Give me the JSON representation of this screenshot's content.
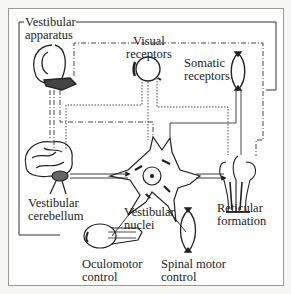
{
  "diagram": {
    "type": "schematic",
    "nodes": [
      {
        "id": "vestibular_apparatus",
        "label_lines": [
          "Vestibular",
          "apparatus"
        ],
        "role": "input"
      },
      {
        "id": "visual_receptors",
        "label_lines": [
          "Visual",
          "receptors"
        ],
        "role": "input"
      },
      {
        "id": "somatic_receptors",
        "label_lines": [
          "Somatic",
          "receptors"
        ],
        "role": "input"
      },
      {
        "id": "vestibular_cerebellum",
        "label_lines": [
          "Vestibular",
          "cerebellum"
        ],
        "role": "integrator"
      },
      {
        "id": "vestibular_nuclei",
        "label_lines": [
          "Vestibular",
          "nuclei"
        ],
        "role": "integrator"
      },
      {
        "id": "reticular_formation",
        "label_lines": [
          "Reticular",
          "formation"
        ],
        "role": "integrator"
      },
      {
        "id": "oculomotor_control",
        "label_lines": [
          "Oculomotor",
          "control"
        ],
        "role": "output"
      },
      {
        "id": "spinal_motor_control",
        "label_lines": [
          "Spinal motor",
          "control"
        ],
        "role": "output"
      }
    ],
    "edges": [
      {
        "from": "vestibular_apparatus",
        "to": "vestibular_cerebellum",
        "style": "dash-dot"
      },
      {
        "from": "vestibular_apparatus",
        "to": "vestibular_nuclei",
        "style": "dash-dot"
      },
      {
        "from": "vestibular_apparatus",
        "to": "reticular_formation",
        "style": "dash-dot"
      },
      {
        "from": "visual_receptors",
        "to": "vestibular_cerebellum",
        "style": "dotted"
      },
      {
        "from": "visual_receptors",
        "to": "vestibular_nuclei",
        "style": "dotted"
      },
      {
        "from": "visual_receptors",
        "to": "reticular_formation",
        "style": "dotted"
      },
      {
        "from": "somatic_receptors",
        "to": "vestibular_cerebellum",
        "style": "solid"
      },
      {
        "from": "somatic_receptors",
        "to": "vestibular_nuclei",
        "style": "solid"
      },
      {
        "from": "somatic_receptors",
        "to": "reticular_formation",
        "style": "solid"
      },
      {
        "from": "vestibular_cerebellum",
        "to": "vestibular_nuclei",
        "style": "solid"
      },
      {
        "from": "vestibular_nuclei",
        "to": "reticular_formation",
        "style": "solid"
      },
      {
        "from": "vestibular_nuclei",
        "to": "oculomotor_control",
        "style": "solid"
      },
      {
        "from": "vestibular_nuclei",
        "to": "spinal_motor_control",
        "style": "solid"
      }
    ]
  },
  "labels": {
    "vestibular_apparatus": {
      "line1": "Vestibular",
      "line2": "apparatus"
    },
    "visual_receptors": {
      "line1": "Visual",
      "line2": "receptors"
    },
    "somatic_receptors": {
      "line1": "Somatic",
      "line2": "receptors"
    },
    "vestibular_cerebellum": {
      "line1": "Vestibular",
      "line2": "cerebellum"
    },
    "vestibular_nuclei": {
      "line1": "Vestibular",
      "line2": "nuclei"
    },
    "reticular_formation": {
      "line1": "Reticular",
      "line2": "formation"
    },
    "oculomotor_control": {
      "line1": "Oculomotor",
      "line2": "control"
    },
    "spinal_motor_control": {
      "line1": "Spinal motor",
      "line2": "control"
    }
  },
  "colors": {
    "ink": "#222222",
    "frame": "#9a9a9a",
    "background": "#ffffff"
  }
}
